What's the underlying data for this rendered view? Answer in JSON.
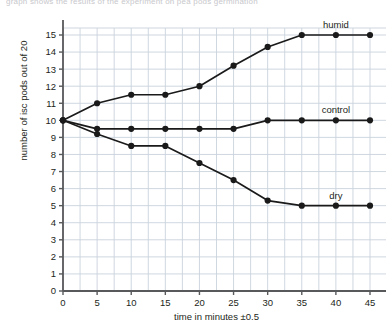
{
  "top_cut_text": "graph shows the results of the experiment on pea pods germination",
  "chart_data": {
    "type": "line",
    "title": "",
    "xlabel": "time in minutes ±0.5",
    "ylabel": "number of isc pods out of 20",
    "x": [
      0,
      5,
      10,
      15,
      20,
      25,
      30,
      35,
      40,
      45
    ],
    "xlim": [
      0,
      45
    ],
    "ylim": [
      0,
      15
    ],
    "xticks": [
      "0",
      "5",
      "10",
      "15",
      "20",
      "25",
      "30",
      "35",
      "40",
      "45"
    ],
    "yticks": [
      "0",
      "1",
      "2",
      "3",
      "4",
      "5",
      "6",
      "7",
      "8",
      "9",
      "10",
      "11",
      "12",
      "13",
      "14",
      "15"
    ],
    "grid": true,
    "legend_position": "inline-right",
    "marker": "filled-circle",
    "line_color": "#1a1a1a",
    "grid_color": "#c9d2dd",
    "axis_color": "#58595b",
    "series": [
      {
        "name": "humid",
        "values": [
          10,
          11,
          11.5,
          11.5,
          12,
          13.2,
          14.3,
          15,
          15,
          15
        ],
        "label_x": 40,
        "label_y": 15.6
      },
      {
        "name": "control",
        "values": [
          10,
          9.5,
          9.5,
          9.5,
          9.5,
          9.5,
          10,
          10,
          10,
          10
        ],
        "label_x": 40,
        "label_y": 10.6
      },
      {
        "name": "dry",
        "values": [
          10,
          9.2,
          8.5,
          8.5,
          7.5,
          6.5,
          5.3,
          5,
          5,
          5
        ],
        "label_x": 40,
        "label_y": 5.6
      }
    ]
  }
}
